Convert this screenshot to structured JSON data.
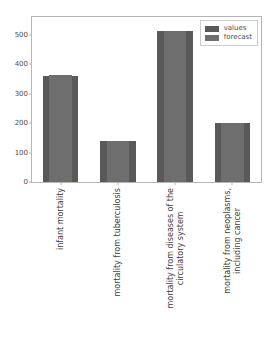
{
  "chart_data": {
    "type": "bar",
    "title": "",
    "subtitle": "",
    "xlabel": "",
    "ylabel": "",
    "categories": [
      "infant mortality",
      "mortality from tuberculosis",
      "mortality from diseases of the circulatory system",
      "mortality from neoplasms, including cancer"
    ],
    "category_lines": [
      [
        "infant mortality"
      ],
      [
        "mortality from tuberculosis"
      ],
      [
        "mortality from diseases of the",
        "circulatory system"
      ],
      [
        "mortality from neoplasms,",
        "including cancer"
      ]
    ],
    "series": [
      {
        "name": "values",
        "values": [
          360,
          138,
          512,
          200
        ],
        "color": "#595959"
      },
      {
        "name": "forecast",
        "values": [
          362,
          139,
          512,
          199
        ],
        "color": "#6e6e6e"
      }
    ],
    "ylim": [
      0,
      560
    ],
    "yticks": [
      0,
      100,
      200,
      300,
      400,
      500
    ],
    "ytick_labels": [
      "0",
      "100",
      "200",
      "300",
      "400",
      "500"
    ],
    "grid": false,
    "legend_position": "upper right"
  },
  "legend": {
    "entries": [
      {
        "label": "values"
      },
      {
        "label": "forecast"
      }
    ]
  },
  "colors": {
    "values": "#595959",
    "forecast": "#6e6e6e",
    "axis": "#b5b5b5",
    "tick_text": "#4d4d4d",
    "label_text": "#3d3d3d",
    "background": "#ffffff"
  }
}
